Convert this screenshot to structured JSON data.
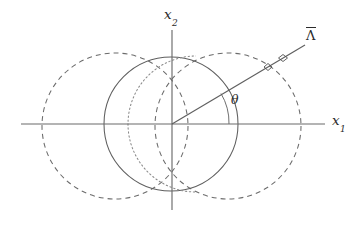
{
  "figure": {
    "title": "",
    "background_color": "#ffffff",
    "line_color": "#6b6b6b",
    "label_color": "#2b2b2b"
  },
  "axes": {
    "origin": {
      "x": 172,
      "y": 124
    },
    "x_axis": {
      "label_base": "x",
      "label_sub": "1",
      "start_x": 21,
      "end_x": 325,
      "y": 124
    },
    "y_axis": {
      "label_base": "x",
      "label_sub": "2",
      "start_y": 30,
      "end_y": 210,
      "x": 172
    }
  },
  "angle": {
    "symbol": "θ",
    "arc_radius": 57,
    "from_degrees": 0,
    "to_degrees": 32
  },
  "ray": {
    "label": "Λ",
    "has_overbar": true,
    "start": {
      "x": 172,
      "y": 124
    },
    "end": {
      "x": 305,
      "y": 45
    },
    "angle_degrees": 30.7,
    "markers": [
      {
        "x": 268,
        "y": 67,
        "type": "diamond"
      },
      {
        "x": 283,
        "y": 58,
        "type": "diamond"
      }
    ]
  },
  "curves": [
    {
      "name": "solid-circle",
      "style": "solid",
      "cx": 171,
      "cy": 124,
      "r": 67,
      "color": "#5f5f5f"
    },
    {
      "name": "dashed-circle-left",
      "style": "dashed",
      "cx": 115,
      "cy": 126,
      "r": 73,
      "color": "#6b6b6b"
    },
    {
      "name": "dashed-circle-right",
      "style": "dashed",
      "cx": 228,
      "cy": 126,
      "r": 73,
      "color": "#6b6b6b"
    },
    {
      "name": "dotted-circle-inner",
      "style": "dotted",
      "cx": 196,
      "cy": 124,
      "r": 68,
      "color": "#8a8a8a"
    }
  ]
}
